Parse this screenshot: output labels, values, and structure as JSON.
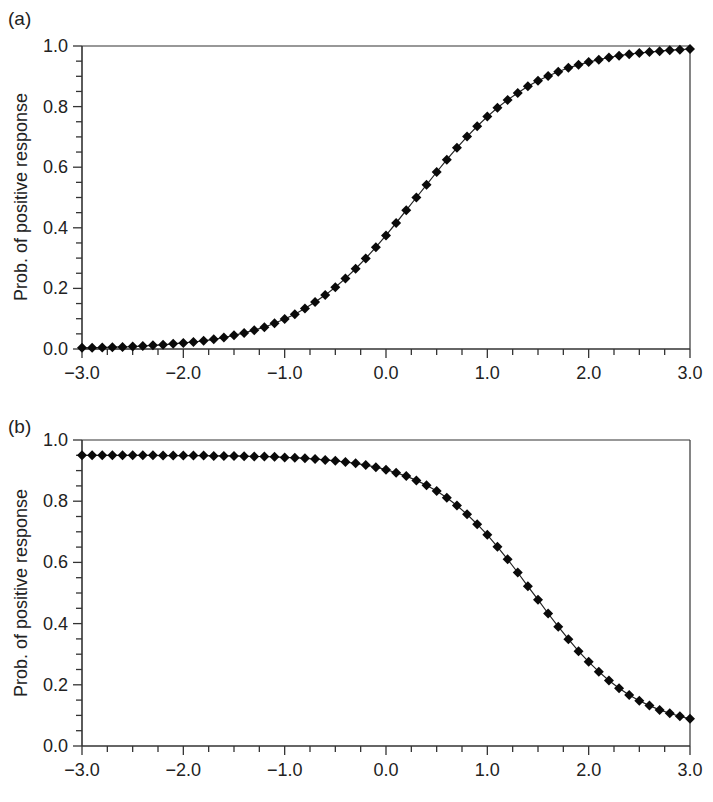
{
  "figure": {
    "panels": [
      {
        "label": "(a)",
        "ylabel": "Prob. of positive response"
      },
      {
        "label": "(b)",
        "ylabel": "Prob. of positive response"
      }
    ]
  },
  "chart_data": [
    {
      "type": "line",
      "title": "(a)",
      "xlabel": "",
      "ylabel": "Prob. of positive response",
      "xlim": [
        -3.0,
        3.0
      ],
      "ylim": [
        0.0,
        1.0
      ],
      "xticks": [
        "-3.0",
        "-2.0",
        "-1.0",
        "0.0",
        "1.0",
        "2.0",
        "3.0"
      ],
      "yticks": [
        "0.0",
        "0.2",
        "0.4",
        "0.6",
        "0.8",
        "1.0"
      ],
      "grid": false,
      "marker": "diamond",
      "x": [
        -3.0,
        -2.9,
        -2.8,
        -2.7,
        -2.6,
        -2.5,
        -2.4,
        -2.3,
        -2.2,
        -2.1,
        -2.0,
        -1.9,
        -1.8,
        -1.7,
        -1.6,
        -1.5,
        -1.4,
        -1.3,
        -1.2,
        -1.1,
        -1.0,
        -0.9,
        -0.8,
        -0.7,
        -0.6,
        -0.5,
        -0.4,
        -0.3,
        -0.2,
        -0.1,
        0.0,
        0.1,
        0.2,
        0.3,
        0.4,
        0.5,
        0.6,
        0.7,
        0.8,
        0.9,
        1.0,
        1.1,
        1.2,
        1.3,
        1.4,
        1.5,
        1.6,
        1.7,
        1.8,
        1.9,
        2.0,
        2.1,
        2.2,
        2.3,
        2.4,
        2.5,
        2.6,
        2.7,
        2.8,
        2.9,
        3.0
      ],
      "values": [
        0.004,
        0.004,
        0.005,
        0.006,
        0.007,
        0.008,
        0.01,
        0.012,
        0.014,
        0.017,
        0.02,
        0.023,
        0.027,
        0.032,
        0.038,
        0.045,
        0.053,
        0.062,
        0.072,
        0.085,
        0.099,
        0.115,
        0.134,
        0.155,
        0.178,
        0.204,
        0.233,
        0.265,
        0.299,
        0.336,
        0.375,
        0.416,
        0.458,
        0.5,
        0.542,
        0.584,
        0.625,
        0.664,
        0.701,
        0.735,
        0.767,
        0.796,
        0.822,
        0.845,
        0.867,
        0.885,
        0.901,
        0.915,
        0.928,
        0.938,
        0.947,
        0.955,
        0.962,
        0.968,
        0.973,
        0.977,
        0.98,
        0.983,
        0.986,
        0.988,
        0.99
      ]
    },
    {
      "type": "line",
      "title": "(b)",
      "xlabel": "",
      "ylabel": "Prob. of positive response",
      "xlim": [
        -3.0,
        3.0
      ],
      "ylim": [
        0.0,
        1.0
      ],
      "xticks": [
        "-3.0",
        "-2.0",
        "-1.0",
        "0.0",
        "1.0",
        "2.0",
        "3.0"
      ],
      "yticks": [
        "0.0",
        "0.2",
        "0.4",
        "0.6",
        "0.8",
        "1.0"
      ],
      "grid": false,
      "marker": "diamond",
      "x": [
        -3.0,
        -2.9,
        -2.8,
        -2.7,
        -2.6,
        -2.5,
        -2.4,
        -2.3,
        -2.2,
        -2.1,
        -2.0,
        -1.9,
        -1.8,
        -1.7,
        -1.6,
        -1.5,
        -1.4,
        -1.3,
        -1.2,
        -1.1,
        -1.0,
        -0.9,
        -0.8,
        -0.7,
        -0.6,
        -0.5,
        -0.4,
        -0.3,
        -0.2,
        -0.1,
        0.0,
        0.1,
        0.2,
        0.3,
        0.4,
        0.5,
        0.6,
        0.7,
        0.8,
        0.9,
        1.0,
        1.1,
        1.2,
        1.3,
        1.4,
        1.5,
        1.6,
        1.7,
        1.8,
        1.9,
        2.0,
        2.1,
        2.2,
        2.3,
        2.4,
        2.5,
        2.6,
        2.7,
        2.8,
        2.9,
        3.0
      ],
      "values": [
        0.95,
        0.95,
        0.95,
        0.95,
        0.95,
        0.95,
        0.95,
        0.95,
        0.949,
        0.949,
        0.949,
        0.949,
        0.949,
        0.948,
        0.948,
        0.948,
        0.947,
        0.946,
        0.946,
        0.945,
        0.943,
        0.942,
        0.94,
        0.938,
        0.935,
        0.932,
        0.928,
        0.924,
        0.918,
        0.911,
        0.903,
        0.893,
        0.882,
        0.868,
        0.852,
        0.833,
        0.811,
        0.786,
        0.757,
        0.725,
        0.69,
        0.651,
        0.61,
        0.567,
        0.522,
        0.478,
        0.433,
        0.39,
        0.349,
        0.31,
        0.275,
        0.243,
        0.214,
        0.189,
        0.167,
        0.148,
        0.132,
        0.118,
        0.107,
        0.097,
        0.089
      ]
    }
  ]
}
